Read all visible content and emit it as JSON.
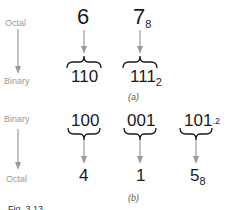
{
  "panel_a": {
    "from_label": "Octal",
    "to_label": "Binary",
    "digits": [
      {
        "value": "6",
        "subscript": ""
      },
      {
        "value": "7",
        "subscript": "8"
      }
    ],
    "groups": [
      {
        "value": "110",
        "subscript": ""
      },
      {
        "value": "111",
        "subscript": "2"
      }
    ],
    "tag": "(a)"
  },
  "panel_b": {
    "from_label": "Binary",
    "to_label": "Octal",
    "groups": [
      {
        "value": "100",
        "subscript": ""
      },
      {
        "value": "001",
        "subscript": ""
      },
      {
        "value": "101",
        "subscript": ".2"
      }
    ],
    "digits": [
      {
        "value": "4",
        "subscript": ""
      },
      {
        "value": "1",
        "subscript": ""
      },
      {
        "value": "5",
        "subscript": "8"
      }
    ],
    "tag": "(b)"
  },
  "caption": "Fig. 3.13",
  "colors": {
    "arrow": "#9a9a9a",
    "text": "#1a1a1a",
    "label": "#9a9a9a"
  }
}
